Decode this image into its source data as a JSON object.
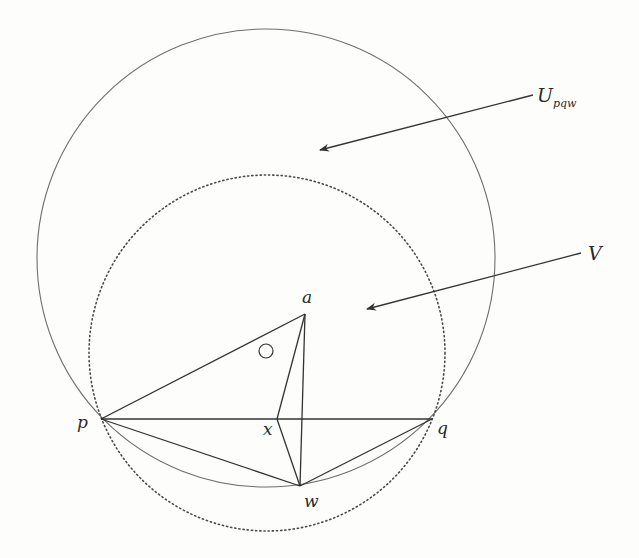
{
  "diagram": {
    "background": "#fdfdfc",
    "stroke_color": "#333333",
    "circle_color": "#6e6e6e",
    "outer_circle": {
      "name": "U_pqw",
      "cx": 266,
      "cy": 258,
      "r": 229,
      "style": "solid"
    },
    "inner_circle": {
      "name": "V",
      "cx": 267,
      "cy": 353,
      "r": 178,
      "style": "dotted"
    },
    "small_circle": {
      "cx": 266,
      "cy": 351,
      "r": 7
    },
    "points": {
      "a": {
        "x": 305,
        "y": 314
      },
      "p": {
        "x": 101,
        "y": 419
      },
      "x": {
        "x": 277,
        "y": 419
      },
      "q": {
        "x": 432,
        "y": 419
      },
      "w": {
        "x": 300,
        "y": 486
      }
    },
    "segments": [
      [
        "p",
        "a"
      ],
      [
        "a",
        "x"
      ],
      [
        "a",
        "w"
      ],
      [
        "p",
        "q"
      ],
      [
        "x",
        "w"
      ],
      [
        "p",
        "w"
      ],
      [
        "w",
        "q"
      ]
    ],
    "labels": {
      "a": "a",
      "p": "p",
      "x": "x",
      "q": "q",
      "w": "w",
      "U_main": "U",
      "U_sub": "pqw",
      "V": "V"
    },
    "arrows": [
      {
        "target": "U_pqw",
        "from": [
          533,
          95
        ],
        "to": [
          320,
          150
        ]
      },
      {
        "target": "V",
        "from": [
          581,
          253
        ],
        "to": [
          367,
          309
        ]
      }
    ]
  }
}
